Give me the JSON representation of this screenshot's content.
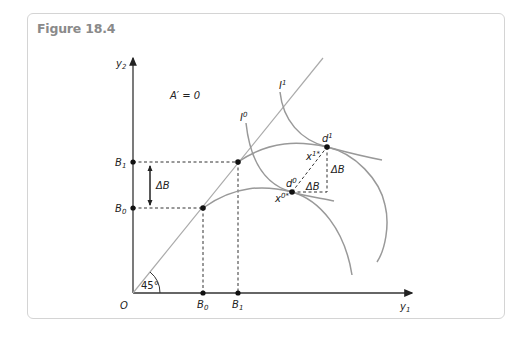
{
  "figure": {
    "title": "Figure 18.4",
    "condition_label": "A′ = 0",
    "angle_label": "45°",
    "origin_label": "O",
    "axes": {
      "x_label": "y",
      "x_sub": "1",
      "y_label": "y",
      "y_sub": "2"
    },
    "y_ticks": [
      {
        "main": "B",
        "sub": "1"
      },
      {
        "main": "B",
        "sub": "0"
      }
    ],
    "x_ticks": [
      {
        "main": "B",
        "sub": "0"
      },
      {
        "main": "B",
        "sub": "1"
      }
    ],
    "delta_label": "ΔB",
    "curves": {
      "I0": {
        "main": "I",
        "sup": "0"
      },
      "I1": {
        "main": "I",
        "sup": "1"
      }
    },
    "points": {
      "d0": {
        "main": "d",
        "sup": "0"
      },
      "d1": {
        "main": "d",
        "sup": "1"
      },
      "x0": {
        "main": "x",
        "sup": "0*"
      },
      "x1": {
        "main": "x",
        "sup": "1*"
      }
    },
    "colors": {
      "axis": "#333333",
      "curve": "#999999",
      "diagonal": "#aaaaaa",
      "frame": "#d4d4d4",
      "title": "#8a8a8a"
    }
  }
}
